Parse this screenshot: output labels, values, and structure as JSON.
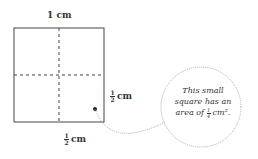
{
  "labels": {
    "top": "1 cm",
    "right_num": "1",
    "right_den": "2",
    "right_unit": "cm",
    "bottom_num": "1",
    "bottom_den": "2",
    "bottom_unit": "cm"
  },
  "note": {
    "line1": "This small",
    "line2": "square has an",
    "line3_pre": "area of",
    "frac_num": "1",
    "frac_den": "4",
    "line3_post": "cm²."
  }
}
